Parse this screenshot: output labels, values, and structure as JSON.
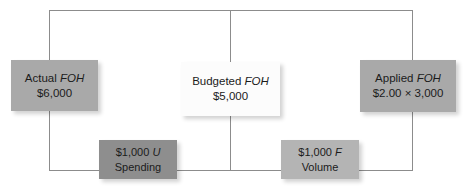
{
  "diagram": {
    "nodes": {
      "actual": {
        "line1_label": "Actual",
        "line1_emphasis": "FOH",
        "line2": "$6,000",
        "color": "#a9a9a9"
      },
      "budgeted": {
        "line1_label": "Budgeted",
        "line1_emphasis": "FOH",
        "line2": "$5,000",
        "color": "#fcfcfc"
      },
      "applied": {
        "line1_label": "Applied",
        "line1_emphasis": "FOH",
        "line2": "$2.00 × 3,000",
        "color": "#a9a9a9"
      },
      "spending": {
        "line1_amount": "$1,000",
        "line1_emphasis": "U",
        "line2": "Spending",
        "color": "#8e8e8e"
      },
      "volume": {
        "line1_amount": "$1,000",
        "line1_emphasis": "F",
        "line2": "Volume",
        "color": "#b4b4b4"
      }
    },
    "connector_color": "#8c8c8c"
  }
}
